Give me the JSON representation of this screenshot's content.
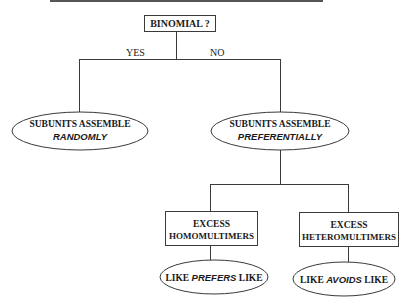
{
  "colors": {
    "line": "#3a3a3a",
    "text": "#1a1a1a",
    "top_rule": "#555555"
  },
  "root": {
    "label": "BINOMIAL ?"
  },
  "branches": {
    "yes": "YES",
    "no": "NO"
  },
  "left_node": {
    "line1": "SUBUNITS ASSEMBLE",
    "line2": "RANDOMLY"
  },
  "right_node": {
    "line1": "SUBUNITS ASSEMBLE",
    "line2": "PREFERENTIALLY"
  },
  "homo_box": {
    "line1": "EXCESS",
    "line2": "HOMOMULTIMERS"
  },
  "hetero_box": {
    "line1": "EXCESS",
    "line2": "HETEROMULTIMERS"
  },
  "homo_leaf": {
    "pre": "LIKE ",
    "em": "PREFERS",
    "post": " LIKE"
  },
  "hetero_leaf": {
    "pre": "LIKE ",
    "em": "AVOIDS",
    "post": " LIKE"
  }
}
